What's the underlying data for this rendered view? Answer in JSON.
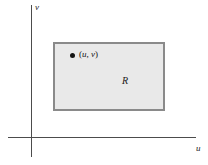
{
  "figure": {
    "type": "coordinate-plane-diagram"
  },
  "axes": {
    "horizontal": {
      "label": "u",
      "name": "u-axis"
    },
    "vertical": {
      "label": "v",
      "name": "v-axis"
    },
    "color": "#4c4c4c"
  },
  "region": {
    "label": "R",
    "fill_color": "#e9e9e9",
    "border_color": "#8a8a8a"
  },
  "point": {
    "marker": "filled-dot",
    "open_paren": "(",
    "u": "u",
    "comma": ", ",
    "v": "v",
    "close_paren": ")",
    "color": "#141414"
  }
}
